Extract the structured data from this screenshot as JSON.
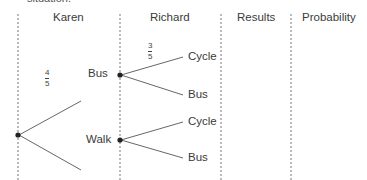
{
  "cut_text": "situation.",
  "headers": [
    "Karen",
    "Richard",
    "Results",
    "Probability"
  ],
  "karen": {
    "branches": [
      {
        "label": "Bus",
        "probability": {
          "num": "4",
          "den": "5"
        }
      },
      {
        "label": "Walk"
      }
    ]
  },
  "richard": {
    "after_bus": [
      {
        "label": "Cycle",
        "probability": {
          "num": "3",
          "den": "5"
        }
      },
      {
        "label": "Bus"
      }
    ],
    "after_walk": [
      {
        "label": "Cycle"
      },
      {
        "label": "Bus"
      }
    ]
  }
}
